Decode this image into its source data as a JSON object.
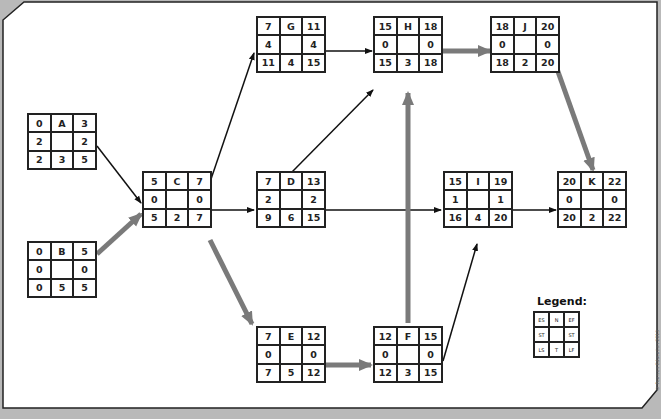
{
  "diagram": {
    "type": "project-network-critical-path",
    "colors": {
      "background": "#b9b9b9",
      "panel": "#ffffff",
      "border": "#222222",
      "normal_arrow": "#111111",
      "critical_arrow": "#7a7a7a"
    },
    "nodes": [
      {
        "id": "A",
        "es": "0",
        "ef": "3",
        "st_left": "2",
        "st_right": "2",
        "ls": "2",
        "t": "3",
        "lf": "5"
      },
      {
        "id": "B",
        "es": "0",
        "ef": "5",
        "st_left": "0",
        "st_right": "0",
        "ls": "0",
        "t": "5",
        "lf": "5"
      },
      {
        "id": "C",
        "es": "5",
        "ef": "7",
        "st_left": "0",
        "st_right": "0",
        "ls": "5",
        "t": "2",
        "lf": "7"
      },
      {
        "id": "G",
        "es": "7",
        "ef": "11",
        "st_left": "4",
        "st_right": "4",
        "ls": "11",
        "t": "4",
        "lf": "15"
      },
      {
        "id": "D",
        "es": "7",
        "ef": "13",
        "st_left": "2",
        "st_right": "2",
        "ls": "9",
        "t": "6",
        "lf": "15"
      },
      {
        "id": "E",
        "es": "7",
        "ef": "12",
        "st_left": "0",
        "st_right": "0",
        "ls": "7",
        "t": "5",
        "lf": "12"
      },
      {
        "id": "H",
        "es": "15",
        "ef": "18",
        "st_left": "0",
        "st_right": "0",
        "ls": "15",
        "t": "3",
        "lf": "18"
      },
      {
        "id": "F",
        "es": "12",
        "ef": "15",
        "st_left": "0",
        "st_right": "0",
        "ls": "12",
        "t": "3",
        "lf": "15"
      },
      {
        "id": "I",
        "es": "15",
        "ef": "19",
        "st_left": "1",
        "st_right": "1",
        "ls": "16",
        "t": "4",
        "lf": "20"
      },
      {
        "id": "J",
        "es": "18",
        "ef": "20",
        "st_left": "0",
        "st_right": "0",
        "ls": "18",
        "t": "2",
        "lf": "20"
      },
      {
        "id": "K",
        "es": "20",
        "ef": "22",
        "st_left": "0",
        "st_right": "0",
        "ls": "20",
        "t": "2",
        "lf": "22"
      }
    ],
    "edges": [
      {
        "from": "A",
        "to": "C",
        "critical": false
      },
      {
        "from": "B",
        "to": "C",
        "critical": true
      },
      {
        "from": "C",
        "to": "G",
        "critical": false
      },
      {
        "from": "C",
        "to": "D",
        "critical": false
      },
      {
        "from": "C",
        "to": "E",
        "critical": true
      },
      {
        "from": "G",
        "to": "H",
        "critical": false
      },
      {
        "from": "D",
        "to": "H",
        "critical": false
      },
      {
        "from": "D",
        "to": "I",
        "critical": false
      },
      {
        "from": "E",
        "to": "F",
        "critical": true
      },
      {
        "from": "F",
        "to": "H",
        "critical": true
      },
      {
        "from": "F",
        "to": "I",
        "critical": false
      },
      {
        "from": "H",
        "to": "J",
        "critical": true
      },
      {
        "from": "I",
        "to": "K",
        "critical": false
      },
      {
        "from": "J",
        "to": "K",
        "critical": true
      }
    ],
    "legend": {
      "title": "Legend:",
      "cells": [
        "ES",
        "N",
        "EF",
        "ST",
        "",
        "ST",
        "LS",
        "T",
        "LF"
      ]
    },
    "copyright": "© Pearson Education 2013"
  }
}
